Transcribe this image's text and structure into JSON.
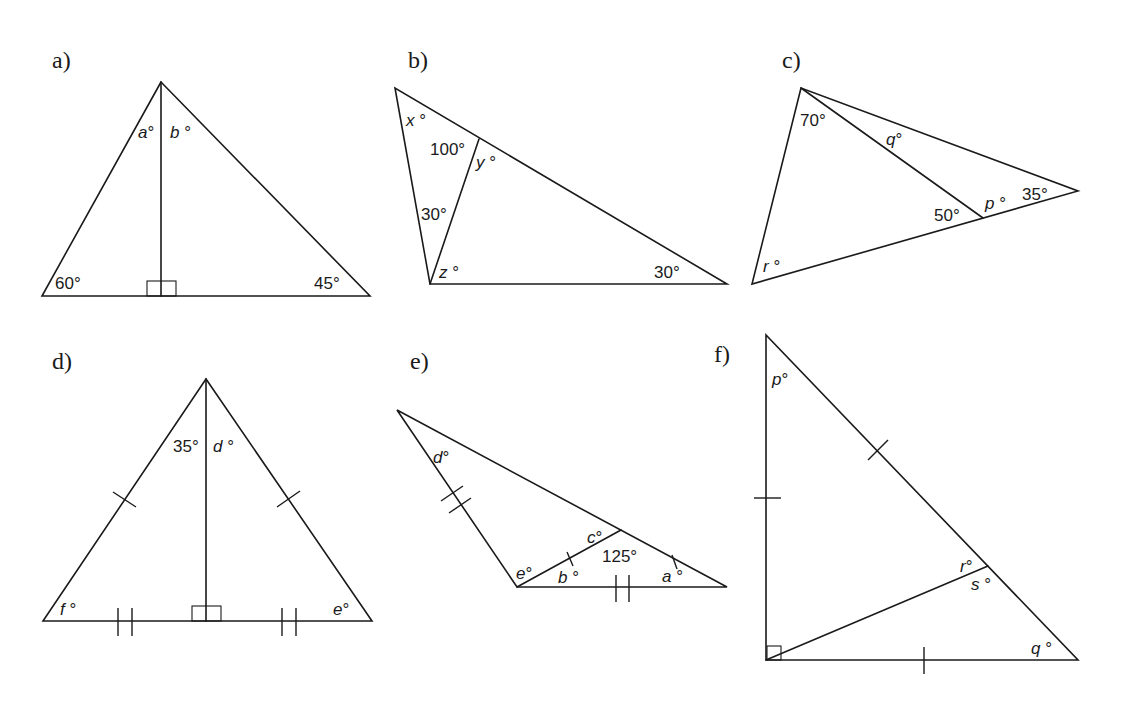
{
  "diagrams": [
    {
      "id": "a",
      "label": "a)",
      "angles": {
        "a": "a°",
        "b": "b°",
        "left": "60°",
        "right": "45°"
      },
      "marks": [
        "right-angle at foot of altitude"
      ]
    },
    {
      "id": "b",
      "label": "b)",
      "angles": {
        "x": "x°",
        "top_inner": "100°",
        "y": "y°",
        "left_inner": "30°",
        "z": "z°",
        "right": "30°"
      }
    },
    {
      "id": "c",
      "label": "c)",
      "angles": {
        "top": "70°",
        "q": "q°",
        "inner": "50°",
        "p": "p°",
        "right": "35°",
        "r": "r°"
      }
    },
    {
      "id": "d",
      "label": "d)",
      "angles": {
        "apex_left": "35°",
        "d": "d°",
        "f": "f°",
        "e": "e°"
      },
      "marks": [
        "single tick on both slanted sides",
        "double tick on both base halves",
        "right-angle at foot of altitude"
      ]
    },
    {
      "id": "e",
      "label": "e)",
      "angles": {
        "d": "d°",
        "c": "c°",
        "inner": "125°",
        "e": "e°",
        "b": "b°",
        "a": "a°"
      },
      "marks": [
        "double tick on left side and base",
        "single tick on cevian and top-right segment"
      ]
    },
    {
      "id": "f",
      "label": "f)",
      "angles": {
        "p": "p°",
        "r": "r°",
        "s": "s°",
        "q": "q°"
      },
      "marks": [
        "single tick on vertical leg, base and upper hypotenuse",
        "right-angle at bottom-left"
      ]
    }
  ]
}
